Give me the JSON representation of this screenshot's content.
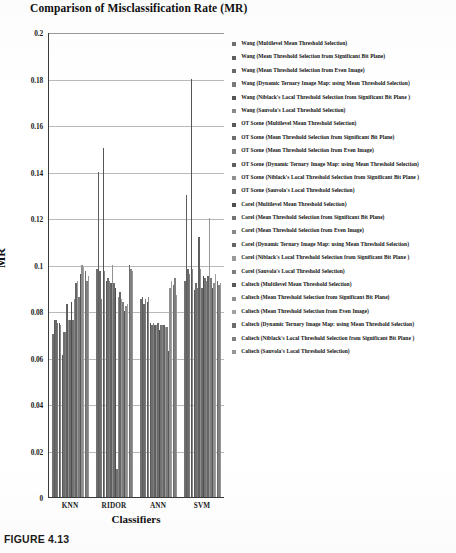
{
  "figure": {
    "caption": "FIGURE 4.13"
  },
  "chart_data": {
    "type": "bar",
    "title": "Comparison of Misclassification Rate (MR)",
    "xlabel": "Classifiers",
    "ylabel": "MR",
    "ylim": [
      0,
      0.2
    ],
    "ytick_labels": [
      "0.2",
      "0.18",
      "0.16",
      "0.14",
      "0.12",
      "0.1",
      "0.08",
      "0.06",
      "0.04",
      "0.02",
      "0"
    ],
    "ytick_values": [
      0.2,
      0.18,
      0.16,
      0.14,
      0.12,
      0.1,
      0.08,
      0.06,
      0.04,
      0.02,
      0
    ],
    "grid": true,
    "legend_position": "right",
    "categories": [
      "KNN",
      "RIDOR",
      "ANN",
      "SVM"
    ],
    "series": [
      {
        "name": "Wang (Multilevel Mean Threshold Selection)",
        "color": "#707070",
        "values": [
          0.07,
          0.098,
          0.085,
          0.093
        ]
      },
      {
        "name": "Wang (Mean Threshold Selection from Significant Bit Plane)",
        "color": "#5e5e5e",
        "values": [
          0.076,
          0.14,
          0.086,
          0.13
        ]
      },
      {
        "name": "Wang (Mean Threshold Selection from Even Image)",
        "color": "#6a6a6a",
        "values": [
          0.076,
          0.097,
          0.083,
          0.098
        ]
      },
      {
        "name": "Wang (Dynamic Ternary Image Map: using Mean Threshold Selection)",
        "color": "#7a7a7a",
        "values": [
          0.075,
          0.085,
          0.085,
          0.096
        ]
      },
      {
        "name": "Wang (Niblack's Local Threshold Selection from Significant Bit Plane )",
        "color": "#555555",
        "values": [
          0.075,
          0.15,
          0.084,
          0.18
        ]
      },
      {
        "name": "Wang (Sauvola's Local Threshold Selection)",
        "color": "#888888",
        "values": [
          0.074,
          0.097,
          0.086,
          0.098
        ]
      },
      {
        "name": "OT Scene (Multilevel Mean Threshold Selection)",
        "color": "#5a5a5a",
        "values": [
          0.061,
          0.093,
          0.075,
          0.089
        ]
      },
      {
        "name": "OT Scene (Mean Threshold Selection from Significant Bit Plane)",
        "color": "#6e6e6e",
        "values": [
          0.071,
          0.094,
          0.074,
          0.092
        ]
      },
      {
        "name": "OT Scene (Mean Threshold Selection from Even Image)",
        "color": "#7d7d7d",
        "values": [
          0.071,
          0.093,
          0.075,
          0.09
        ]
      },
      {
        "name": "OT Scene (Dynamic Ternary Image Map: using Mean Threshold Selection)",
        "color": "#606060",
        "values": [
          0.083,
          0.092,
          0.074,
          0.112
        ]
      },
      {
        "name": "OT Scene (Niblack's Local Threshold Selection from Significant Bit Plane )",
        "color": "#909090",
        "values": [
          0.076,
          0.1,
          0.074,
          0.098
        ]
      },
      {
        "name": "OT Scene (Sauvola's Local Threshold Selection)",
        "color": "#6b6b6b",
        "values": [
          0.076,
          0.092,
          0.075,
          0.09
        ]
      },
      {
        "name": "Corel (Multilevel Mean Threshold Selection)",
        "color": "#4f4f4f",
        "values": [
          0.084,
          0.09,
          0.072,
          0.095
        ]
      },
      {
        "name": "Corel (Mean Threshold Selection from Significant Bit Plane)",
        "color": "#737373",
        "values": [
          0.076,
          0.012,
          0.074,
          0.094
        ]
      },
      {
        "name": "Corel (Mean Threshold Selection from Even Image)",
        "color": "#868686",
        "values": [
          0.085,
          0.086,
          0.074,
          0.093
        ]
      },
      {
        "name": "Corel (Dynamic Ternary Image Map: using Mean Threshold Selection)",
        "color": "#656565",
        "values": [
          0.092,
          0.088,
          0.074,
          0.095
        ]
      },
      {
        "name": "Corel (Niblack's Local Threshold Selection from Significant Bit Plane )",
        "color": "#9a9a9a",
        "values": [
          0.093,
          0.085,
          0.073,
          0.12
        ]
      },
      {
        "name": "Corel (Sauvola's Local Threshold Selection)",
        "color": "#7c7c7c",
        "values": [
          0.086,
          0.084,
          0.073,
          0.094
        ]
      },
      {
        "name": "Caltech (Multilevel Mean Threshold Selection)",
        "color": "#585858",
        "values": [
          0.096,
          0.08,
          0.063,
          0.09
        ]
      },
      {
        "name": "Caltech (Mean Threshold Selection from Significant Bit Plane)",
        "color": "#8f8f8f",
        "values": [
          0.1,
          0.082,
          0.09,
          0.092
        ]
      },
      {
        "name": "Caltech (Mean Threshold Selection from Even Image)",
        "color": "#a0a0a0",
        "values": [
          0.099,
          0.083,
          0.093,
          0.096
        ]
      },
      {
        "name": "Caltech (Dynamic Ternary Image Map: using Mean Threshold Selection)",
        "color": "#6d6d6d",
        "values": [
          0.097,
          0.1,
          0.091,
          0.093
        ]
      },
      {
        "name": "Caltech (Niblack's Local Threshold Selection from Significant Bit Plane )",
        "color": "#7f7f7f",
        "values": [
          0.093,
          0.098,
          0.094,
          0.091
        ]
      },
      {
        "name": "Caltech (Sauvola's Local Threshold Selection)",
        "color": "#969696",
        "values": [
          0.095,
          0.097,
          0.087,
          0.092
        ]
      }
    ]
  }
}
